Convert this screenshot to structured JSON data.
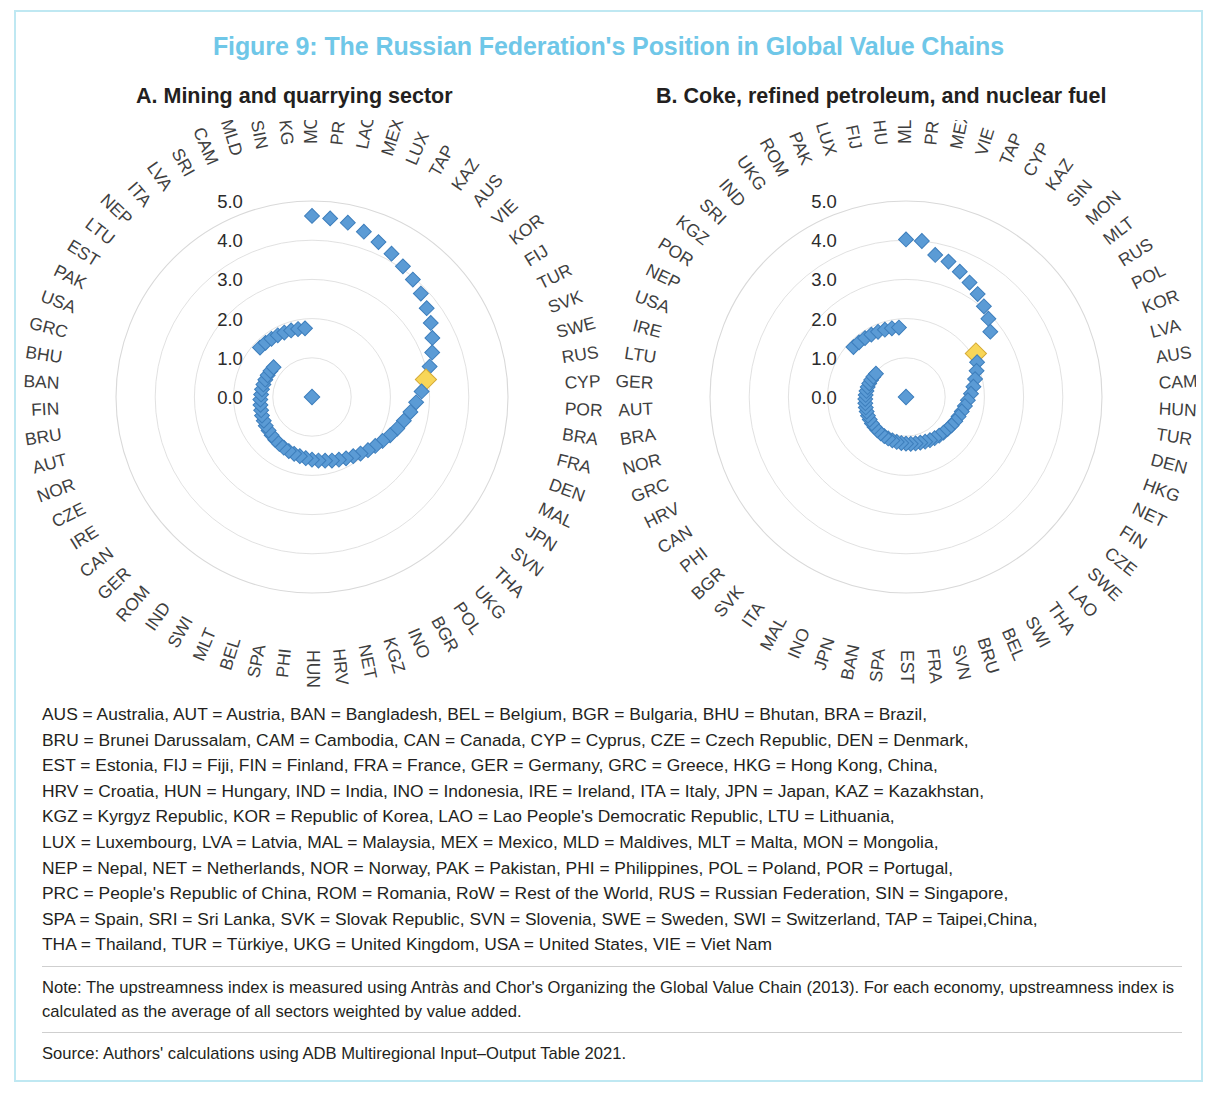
{
  "figure": {
    "title": "Figure 9: The Russian Federation's Position in Global Value Chains",
    "title_color": "#6fc7e8",
    "border_color": "#bfe8f2"
  },
  "panels": {
    "a_title": "A. Mining and quarrying sector",
    "b_title": "B. Coke, refined petroleum, and nuclear fuel"
  },
  "colors": {
    "marker": "#5b9bd5",
    "marker_edge": "#3d7ebc",
    "highlight": "#f8d658",
    "highlight_edge": "#d4a935",
    "grid": "#d9d9d9",
    "label": "#3f3f3f"
  },
  "abbreviations": [
    "AUS = Australia, AUT = Austria, BAN = Bangladesh, BEL = Belgium, BGR = Bulgaria, BHU = Bhutan, BRA = Brazil,",
    "BRU = Brunei Darussalam, CAM = Cambodia, CAN = Canada, CYP = Cyprus, CZE = Czech Republic, DEN = Denmark,",
    "EST = Estonia, FIJ = Fiji, FIN = Finland, FRA = France, GER = Germany, GRC = Greece, HKG = Hong Kong, China,",
    "HRV = Croatia, HUN = Hungary, IND = India, INO = Indonesia, IRE = Ireland, ITA = Italy, JPN = Japan, KAZ = Kazakhstan,",
    "KGZ = Kyrgyz Republic, KOR = Republic of Korea, LAO = Lao People's Democratic Republic, LTU = Lithuania,",
    "LUX = Luxembourg, LVA = Latvia, MAL = Malaysia, MEX = Mexico, MLD = Maldives, MLT = Malta, MON = Mongolia,",
    "NEP = Nepal, NET = Netherlands, NOR = Norway, PAK = Pakistan, PHI = Philippines, POL = Poland, POR = Portugal,",
    "PRC = People's Republic of China, ROM = Romania, RoW = Rest of the World, RUS = Russian Federation, SIN = Singapore,",
    "SPA = Spain, SRI = Sri Lanka, SVK = Slovak Republic, SVN = Slovenia, SWE = Sweden, SWI = Switzerland, TAP = Taipei,China,",
    "THA = Thailand, TUR = Türkiye, UKG = United Kingdom, USA = United States, VIE = Viet Nam"
  ],
  "note": "Note: The upstreamness index is measured using Antràs and Chor's Organizing the Global Value Chain (2013). For each economy, upstreamness index is calculated as the average of all sectors weighted by value added.",
  "source": "Source: Authors' calculations using ADB Multiregional Input–Output Table 2021.",
  "chart_data": [
    {
      "type": "scatter",
      "projection": "polar",
      "title": "A. Mining and quarrying sector",
      "ylabel": "Upstreamness index",
      "rlim": [
        0,
        5.0
      ],
      "rticks": [
        0.0,
        1.0,
        2.0,
        3.0,
        4.0,
        5.0
      ],
      "rtick_labels": [
        "0.0",
        "1.0",
        "2.0",
        "3.0",
        "4.0",
        "5.0"
      ],
      "grid": true,
      "highlight": "RUS",
      "categories": [
        "MON",
        "PRC",
        "LAO",
        "MEX",
        "LUX",
        "TAP",
        "KAZ",
        "AUS",
        "VIE",
        "KOR",
        "FIJ",
        "TUR",
        "SVK",
        "SWE",
        "RUS",
        "CYP",
        "POR",
        "BRA",
        "FRA",
        "DEN",
        "MAL",
        "JPN",
        "SVN",
        "THA",
        "UKG",
        "POL",
        "BGR",
        "INO",
        "KGZ",
        "NET",
        "HRV",
        "HUN",
        "PHI",
        "SPA",
        "BEL",
        "MLT",
        "SWI",
        "IND",
        "ROM",
        "GER",
        "CAN",
        "IRE",
        "CZE",
        "NOR",
        "AUT",
        "BRU",
        "FIN",
        "BAN",
        "BHU",
        "GRC",
        "USA",
        "PAK",
        "EST",
        "LTU",
        "NEP",
        "ITA",
        "LVA",
        "SRI",
        "CAM",
        "MLD",
        "SIN",
        "HKG"
      ],
      "values": [
        4.62,
        4.58,
        4.54,
        4.42,
        4.3,
        4.18,
        4.06,
        3.95,
        3.83,
        3.7,
        3.57,
        3.42,
        3.27,
        3.1,
        2.94,
        2.8,
        2.66,
        2.54,
        2.42,
        2.32,
        2.22,
        2.12,
        2.04,
        1.97,
        1.9,
        1.84,
        1.79,
        1.74,
        1.7,
        1.66,
        1.63,
        1.6,
        1.57,
        1.54,
        1.52,
        1.5,
        1.48,
        1.46,
        1.44,
        1.42,
        1.4,
        1.39,
        1.37,
        1.36,
        1.34,
        1.33,
        1.32,
        1.3,
        1.29,
        1.28,
        1.27,
        1.26,
        1.25,
        1.24,
        1.83,
        1.82,
        1.81,
        1.8,
        1.79,
        1.78,
        1.77,
        1.76
      ]
    },
    {
      "type": "scatter",
      "projection": "polar",
      "title": "B. Coke, refined petroleum, and nuclear fuel",
      "ylabel": "Upstreamness index",
      "rlim": [
        0,
        5.0
      ],
      "rticks": [
        0.0,
        1.0,
        2.0,
        3.0,
        4.0,
        5.0
      ],
      "rtick_labels": [
        "0.0",
        "1.0",
        "2.0",
        "3.0",
        "4.0",
        "5.0"
      ],
      "grid": true,
      "highlight": "RUS",
      "categories": [
        "MLD",
        "PRC",
        "MEX",
        "VIE",
        "TAP",
        "CYP",
        "KAZ",
        "SIN",
        "MON",
        "MLT",
        "RUS",
        "POL",
        "KOR",
        "LVA",
        "AUS",
        "CAM",
        "HUN",
        "TUR",
        "DEN",
        "HKG",
        "NET",
        "FIN",
        "CZE",
        "SWE",
        "LAO",
        "THA",
        "SWI",
        "BEL",
        "BRU",
        "SVN",
        "FRA",
        "EST",
        "SPA",
        "BAN",
        "JPN",
        "INO",
        "MAL",
        "ITA",
        "SVK",
        "BGR",
        "PHI",
        "CAN",
        "HRV",
        "GRC",
        "NOR",
        "BRA",
        "AUT",
        "GER",
        "LTU",
        "IRE",
        "USA",
        "NEP",
        "POR",
        "KGZ",
        "SRI",
        "IND",
        "UKG",
        "ROM",
        "PAK",
        "LUX",
        "FIJ",
        "BHU"
      ],
      "values": [
        4.02,
        4.0,
        3.7,
        3.62,
        3.48,
        3.34,
        3.2,
        3.05,
        2.9,
        2.72,
        2.1,
        2.02,
        1.92,
        1.82,
        1.74,
        1.66,
        1.58,
        1.52,
        1.47,
        1.43,
        1.4,
        1.37,
        1.34,
        1.32,
        1.3,
        1.28,
        1.26,
        1.24,
        1.22,
        1.21,
        1.2,
        1.19,
        1.18,
        1.17,
        1.16,
        1.15,
        1.14,
        1.13,
        1.12,
        1.11,
        1.1,
        1.09,
        1.08,
        1.07,
        1.06,
        1.05,
        1.04,
        1.03,
        1.02,
        1.01,
        1.0,
        0.99,
        0.98,
        0.97,
        1.85,
        1.84,
        1.83,
        1.82,
        1.81,
        1.8,
        1.79,
        1.78
      ]
    }
  ]
}
